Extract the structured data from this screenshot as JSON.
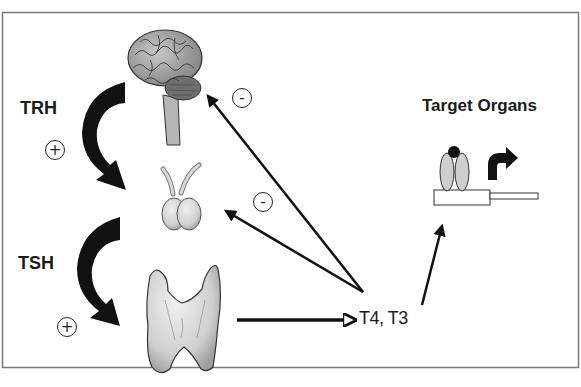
{
  "diagram": {
    "type": "hypothalamic-pituitary-thyroid-axis",
    "labels": {
      "trh": "TRH",
      "tsh": "TSH",
      "hormones": "T4, T3",
      "target": "Target Organs"
    },
    "signs": {
      "trh_effect": "+",
      "tsh_effect": "+",
      "feedback_brain": "-",
      "feedback_pituitary": "-"
    },
    "nodes": [
      {
        "id": "brain",
        "name": "Hypothalamus / brain"
      },
      {
        "id": "pituitary",
        "name": "Pituitary"
      },
      {
        "id": "thyroid",
        "name": "Thyroid"
      },
      {
        "id": "hormones",
        "name": "T4, T3"
      },
      {
        "id": "target",
        "name": "Target Organs"
      }
    ],
    "edges": [
      {
        "from": "brain",
        "to": "pituitary",
        "label": "TRH",
        "sign": "+"
      },
      {
        "from": "pituitary",
        "to": "thyroid",
        "label": "TSH",
        "sign": "+"
      },
      {
        "from": "thyroid",
        "to": "hormones"
      },
      {
        "from": "hormones",
        "to": "brain",
        "sign": "-"
      },
      {
        "from": "hormones",
        "to": "pituitary",
        "sign": "-"
      },
      {
        "from": "hormones",
        "to": "target"
      }
    ],
    "colors": {
      "ink": "#111111",
      "organ_fill": "#d9d9d9",
      "organ_shade": "#9a9a9a",
      "frame": "#7a7a7a"
    }
  }
}
